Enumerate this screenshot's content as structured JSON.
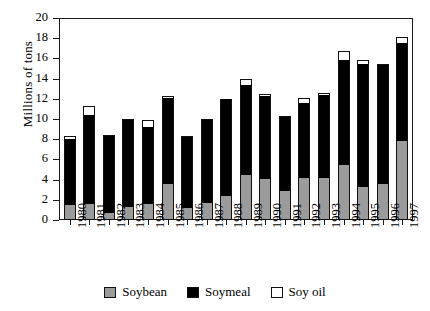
{
  "chart_data": {
    "type": "bar",
    "stacked": true,
    "title": "",
    "xlabel": "",
    "ylabel": "Millions of tons",
    "ylim": [
      0,
      20
    ],
    "ytick_step": 2,
    "yticks": [
      "0",
      "2",
      "4",
      "6",
      "8",
      "10",
      "12",
      "14",
      "16",
      "18",
      "20"
    ],
    "grid": false,
    "legend_position": "bottom",
    "categories": [
      "1980",
      "1981",
      "1982",
      "1983",
      "1984",
      "1985",
      "1986",
      "1987",
      "1988",
      "1989",
      "1990",
      "1991",
      "1992",
      "1993",
      "1994",
      "1995",
      "1996",
      "1997"
    ],
    "series": [
      {
        "name": "Soybean",
        "color": "#9b9b9b",
        "values": [
          1.5,
          1.6,
          0.7,
          1.3,
          1.6,
          3.6,
          1.2,
          1.7,
          2.4,
          4.5,
          4.1,
          2.9,
          4.2,
          4.2,
          5.4,
          3.3,
          3.6,
          7.8
        ]
      },
      {
        "name": "Soymeal",
        "color": "#000000",
        "values": [
          6.5,
          8.8,
          7.6,
          8.6,
          7.6,
          8.5,
          7.0,
          8.2,
          9.6,
          8.9,
          8.2,
          7.3,
          7.4,
          8.2,
          10.4,
          12.1,
          11.7,
          9.7
        ]
      },
      {
        "name": "Soy oil",
        "color": "#ffffff",
        "values": [
          0.3,
          0.9,
          0.1,
          0.1,
          0.7,
          0.2,
          0.1,
          0.1,
          0.0,
          0.6,
          0.1,
          0.1,
          0.5,
          0.2,
          0.9,
          0.4,
          0.1,
          0.6
        ]
      }
    ],
    "totals": [
      8.3,
      11.3,
      8.4,
      10.0,
      9.9,
      12.3,
      8.3,
      10.0,
      12.0,
      14.0,
      12.4,
      10.3,
      12.1,
      12.6,
      16.7,
      15.8,
      15.4,
      18.1
    ]
  },
  "legend": {
    "items": [
      {
        "label": "Soybean",
        "swatch": "gray-square-icon"
      },
      {
        "label": "Soymeal",
        "swatch": "black-square-icon"
      },
      {
        "label": "Soy oil",
        "swatch": "white-square-icon"
      }
    ]
  }
}
